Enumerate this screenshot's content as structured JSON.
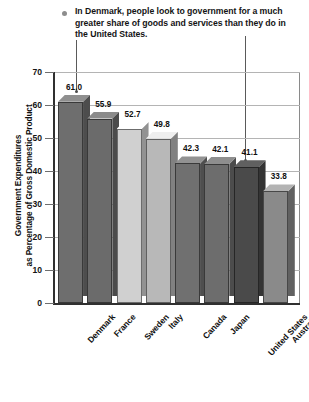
{
  "caption": {
    "bullet": "round-bullet",
    "text": "In Denmark, people look to government for a much greater share of goods and services than they do in the United States."
  },
  "chart_data": {
    "type": "bar",
    "title": "",
    "xlabel": "",
    "ylabel": "Government Expenditures as Percentage of Gross Domestic Product",
    "ylabel_line1": "Government Expenditures",
    "ylabel_line2": "as Percentage of Gross Domestic Product",
    "ylim": [
      0,
      70
    ],
    "ytick_step": 10,
    "ytick_labels": [
      "70",
      "60",
      "50",
      "40",
      "30",
      "20",
      "10",
      "0"
    ],
    "grid": true,
    "legend": "none",
    "categories": [
      "Denmark",
      "France",
      "Sweden",
      "Italy",
      "Canada",
      "Japan",
      "United States",
      "Australia"
    ],
    "values": [
      61.0,
      55.9,
      52.7,
      49.8,
      42.3,
      42.1,
      41.1,
      33.8
    ],
    "value_labels": [
      "61.0",
      "55.9",
      "52.7",
      "49.8",
      "42.3",
      "42.1",
      "41.1",
      "33.8"
    ],
    "bar_colors": [
      "#6e6e6e",
      "#6b6b6b",
      "#d0d0d0",
      "#b8b8b8",
      "#707070",
      "#6d6d6d",
      "#4a4a4a",
      "#8a8a8a"
    ],
    "annotations": [
      {
        "name": "denmark-pointer",
        "target": "Denmark"
      },
      {
        "name": "united-states-pointer",
        "target": "United States"
      }
    ]
  },
  "colors": {
    "axis": "#303030",
    "grid": "#b4b4b4",
    "frame": "#8a8a8a",
    "text": "#101010",
    "bullet": "#8d8d8d",
    "leader": "#5a5a5a"
  }
}
